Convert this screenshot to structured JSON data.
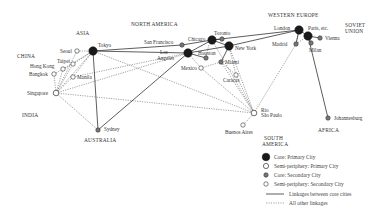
{
  "regions": {
    "asia": "ASIA",
    "china": "CHINA",
    "india": "INDIA",
    "australia": "AUSTRALIA",
    "north_america": "NORTH AMERICA",
    "south_america_1": "SOUTH",
    "south_america_2": "AMERICA",
    "western_europe": "WESTERN EUROPE",
    "soviet_union_1": "SOVIET",
    "soviet_union_2": "UNION",
    "africa": "AFRICA"
  },
  "cities": {
    "tokyo": "Tokyo",
    "seoul": "Seoul",
    "taipei": "Taipei",
    "hong_kong": "Hong Kong",
    "bangkok": "Bangkok",
    "manila": "Manila",
    "singapore": "Singapore",
    "sydney": "Sydney",
    "san_francisco": "San Francisco",
    "los_angeles_1": "Los",
    "los_angeles_2": "Angeles",
    "chicago": "Chicago",
    "toronto": "Toronto",
    "houston": "Houston",
    "new_york": "New York",
    "mexico": "Mexico",
    "miami": "Miami",
    "caracas": "Caracas",
    "rio_1": "Rio",
    "rio_2": "São Paulo",
    "buenos_aires": "Buenos Aires",
    "london": "London",
    "paris": "Paris, etc.",
    "vienna": "Vienna",
    "madrid": "Madrid",
    "milan": "Milan",
    "johannesburg": "Johannesburg"
  },
  "legend": {
    "core_primary": "Core: Primary City",
    "semi_primary": "Semi-periphery: Primary City",
    "core_secondary": "Core: Secondary City",
    "semi_secondary": "Semi-periphery: Secondary City",
    "core_links": "Linkages between core cities",
    "other_links": "All other linkages"
  },
  "colors": {
    "core_primary": "#1a1a1a",
    "core_secondary": "#777777",
    "semi_periphery": "#ffffff",
    "line": "#333333"
  }
}
